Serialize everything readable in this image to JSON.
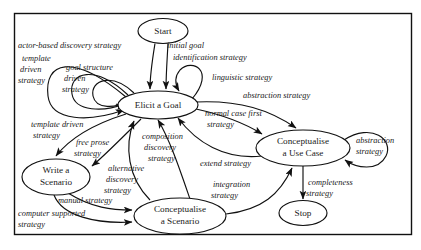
{
  "diagram": {
    "frame": {
      "x": 14,
      "y": 13,
      "width": 398,
      "height": 222
    },
    "colors": {
      "stroke": "#111111",
      "text": "#1a1a1a",
      "background": "#ffffff"
    },
    "nodes": [
      {
        "id": "start",
        "label": "Start",
        "lines": [
          "Start"
        ],
        "cx": 163,
        "cy": 31,
        "rx": 25,
        "ry": 12.5
      },
      {
        "id": "elicit_goal",
        "label": "Elicit a Goal",
        "lines": [
          "Elicit a Goal"
        ],
        "cx": 158,
        "cy": 105,
        "rx": 40,
        "ry": 14
      },
      {
        "id": "use_case",
        "label": "Conceptualise a Use Case",
        "lines": [
          "Conceptualise",
          "a Use Case"
        ],
        "cx": 303,
        "cy": 148,
        "rx": 47,
        "ry": 18
      },
      {
        "id": "write_scen",
        "label": "Write a Scenario",
        "lines": [
          "Write a",
          "Scenario"
        ],
        "cx": 56,
        "cy": 177,
        "rx": 34,
        "ry": 18
      },
      {
        "id": "concept_scen",
        "label": "Conceptualise a Scenario",
        "lines": [
          "Conceptualise",
          "a Scenario"
        ],
        "cx": 180,
        "cy": 216,
        "rx": 46,
        "ry": 18
      },
      {
        "id": "stop",
        "label": "Stop",
        "lines": [
          "Stop"
        ],
        "cx": 303,
        "cy": 213,
        "rx": 24,
        "ry": 12.5
      }
    ],
    "edges": [
      {
        "id": "e1",
        "from": "start",
        "to": "elicit_goal",
        "label": "initial goal identification strategy"
      },
      {
        "id": "e2",
        "from": "elicit_goal",
        "to": "elicit_goal",
        "label": "actor-based discovery strategy"
      },
      {
        "id": "e3",
        "from": "elicit_goal",
        "to": "elicit_goal",
        "label": "template driven strategy"
      },
      {
        "id": "e4",
        "from": "elicit_goal",
        "to": "elicit_goal",
        "label": "goal structure driven strategy"
      },
      {
        "id": "e5",
        "from": "elicit_goal",
        "to": "elicit_goal",
        "label": "linguistic strategy"
      },
      {
        "id": "e6",
        "from": "elicit_goal",
        "to": "use_case",
        "label": "abstraction strategy"
      },
      {
        "id": "e7",
        "from": "elicit_goal",
        "to": "use_case",
        "label": "normal case first strategy"
      },
      {
        "id": "e8",
        "from": "elicit_goal",
        "to": "write_scen",
        "label": "template driven strategy"
      },
      {
        "id": "e9",
        "from": "write_scen",
        "to": "elicit_goal",
        "label": "free prose strategy"
      },
      {
        "id": "e10",
        "from": "concept_scen",
        "to": "elicit_goal",
        "label": "alternative discovery strategy"
      },
      {
        "id": "e11",
        "from": "concept_scen",
        "to": "elicit_goal",
        "label": "composition discovery strategy"
      },
      {
        "id": "e12",
        "from": "use_case",
        "to": "elicit_goal",
        "label": "extend strategy"
      },
      {
        "id": "e13",
        "from": "use_case",
        "to": "use_case",
        "label": "abstraction strategy"
      },
      {
        "id": "e14",
        "from": "write_scen",
        "to": "concept_scen",
        "label": "manual strategy"
      },
      {
        "id": "e15",
        "from": "write_scen",
        "to": "concept_scen",
        "label": "computer supported strategy"
      },
      {
        "id": "e16",
        "from": "concept_scen",
        "to": "use_case",
        "label": "integration strategy"
      },
      {
        "id": "e17",
        "from": "use_case",
        "to": "stop",
        "label": "completeness strategy"
      }
    ],
    "edge_labels": [
      {
        "id": "l_actor",
        "text": "actor-based discovery strategy",
        "x": 18,
        "y": 48,
        "lines": [
          "actor-based discovery strategy"
        ]
      },
      {
        "id": "l_initial",
        "text": "initial goal identification strategy",
        "x": 167,
        "y": 48,
        "lines": [
          "initial goal",
          "identification strategy"
        ]
      },
      {
        "id": "l_template1",
        "text": "template driven strategy",
        "x": 22,
        "y": 61,
        "lines": [
          "template",
          "driven",
          "strategy"
        ]
      },
      {
        "id": "l_goalstruct",
        "text": "goal structure driven strategy",
        "x": 66,
        "y": 70,
        "lines": [
          "goal structure",
          "driven",
          "strategy"
        ]
      },
      {
        "id": "l_linguistic",
        "text": "linguistic strategy",
        "x": 212,
        "y": 80,
        "lines": [
          "linguistic strategy"
        ]
      },
      {
        "id": "l_abstraction1",
        "text": "abstraction strategy",
        "x": 243,
        "y": 98,
        "lines": [
          "abstraction strategy"
        ]
      },
      {
        "id": "l_normalcase",
        "text": "normal case first strategy",
        "x": 205,
        "y": 116,
        "lines": [
          "normal case first",
          "strategy"
        ]
      },
      {
        "id": "l_template2",
        "text": "template driven strategy",
        "x": 31,
        "y": 127,
        "lines": [
          "template driven",
          "strategy"
        ]
      },
      {
        "id": "l_freeprose",
        "text": "free prose strategy",
        "x": 76,
        "y": 145,
        "lines": [
          "free prose",
          "strategy"
        ]
      },
      {
        "id": "l_composition",
        "text": "composition discovery strategy",
        "x": 142,
        "y": 139,
        "lines": [
          "composition",
          "discovery",
          "strategy"
        ]
      },
      {
        "id": "l_alternative",
        "text": "alternative discovery strategy",
        "x": 108,
        "y": 171,
        "lines": [
          "alternative",
          "discovery",
          "strategy"
        ]
      },
      {
        "id": "l_extend",
        "text": "extend strategy",
        "x": 200,
        "y": 166,
        "lines": [
          "extend strategy"
        ]
      },
      {
        "id": "l_abstraction2",
        "text": "abstraction strategy",
        "x": 356,
        "y": 143,
        "lines": [
          "abstraction",
          "strategy"
        ]
      },
      {
        "id": "l_integration",
        "text": "integration strategy",
        "x": 213,
        "y": 187,
        "lines": [
          "integration",
          "strategy"
        ]
      },
      {
        "id": "l_completeness",
        "text": "completeness strategy",
        "x": 308,
        "y": 185,
        "lines": [
          "completeness",
          "strategy"
        ]
      },
      {
        "id": "l_manual",
        "text": "manual strategy",
        "x": 58,
        "y": 203,
        "lines": [
          "manual strategy"
        ]
      },
      {
        "id": "l_computer",
        "text": "computer supported strategy",
        "x": 18,
        "y": 216,
        "lines": [
          "computer supported",
          "strategy"
        ]
      }
    ]
  }
}
